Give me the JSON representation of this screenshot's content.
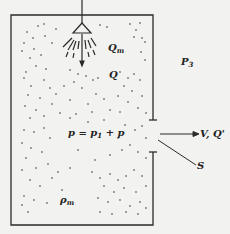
{
  "diagram": {
    "type": "spray-chamber-schematic",
    "labels": {
      "spray_flow": {
        "main": "Q",
        "sub": "m"
      },
      "flow": {
        "main": "Q",
        "sub": ""
      },
      "outside_pressure": {
        "main": "P",
        "sub": "3"
      },
      "pressure_equation": {
        "lhs": "p",
        "eq": " = ",
        "p1": "p",
        "p1_sub": "1",
        "plus": " + ",
        "p2": "p"
      },
      "outlet": "V, Q'",
      "opening": "S",
      "density": {
        "main": "ρ",
        "sub": "m"
      }
    },
    "colors": {
      "line": "#2a2a2a",
      "background": "#f2f2f0",
      "text": "#222222"
    }
  }
}
